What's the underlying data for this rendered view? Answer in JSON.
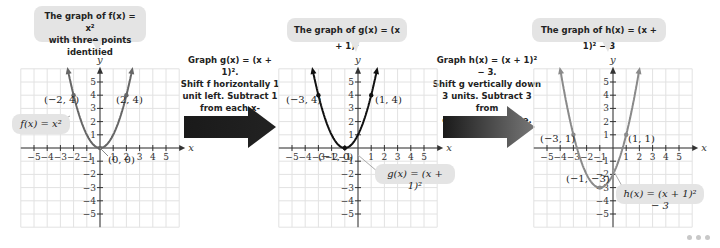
{
  "callouts": {
    "f_title_line1": "The graph of f(x) = x²",
    "f_title_line2": "with three points identified",
    "g_title": "The graph of g(x) = (x + 1)²",
    "h_title": "The graph of h(x) = (x + 1)² − 3"
  },
  "steps": {
    "step1": [
      "Graph g(x) = (x + 1)².",
      "Shift f horizontally 1",
      "unit left. Subtract 1",
      "from each x-coordinate."
    ],
    "step2": [
      "Graph h(x) = (x + 1)² − 3.",
      "Shift g vertically down",
      "3 units. Subtract 3 from",
      "each y-coordinate."
    ]
  },
  "labels": {
    "f_label": "f(x) = x²",
    "g_label": "g(x) = (x + 1)²",
    "h_label": "h(x) = (x + 1)² − 3",
    "x_axis": "x",
    "y_axis": "y"
  },
  "chart_data": [
    {
      "type": "line",
      "title": "The graph of f(x) = x² with three points identified",
      "function": "f(x) = x^2",
      "xlabel": "x",
      "ylabel": "y",
      "xlim": [
        -6,
        6
      ],
      "ylim": [
        -6,
        6
      ],
      "x_ticks": [
        -5,
        -4,
        -3,
        -2,
        -1,
        1,
        2,
        3,
        4,
        5
      ],
      "y_ticks": [
        -5,
        -4,
        -3,
        -2,
        -1,
        1,
        2,
        3,
        4,
        5
      ],
      "grid": true,
      "color": "#666666",
      "points": [
        {
          "x": -2,
          "y": 4,
          "label": "(−2, 4)"
        },
        {
          "x": 0,
          "y": 0,
          "label": "(0, 0)"
        },
        {
          "x": 2,
          "y": 4,
          "label": "(2, 4)"
        }
      ]
    },
    {
      "type": "line",
      "title": "The graph of g(x) = (x + 1)²",
      "function": "g(x) = (x+1)^2",
      "xlabel": "x",
      "ylabel": "y",
      "xlim": [
        -6,
        6
      ],
      "ylim": [
        -6,
        6
      ],
      "x_ticks": [
        -5,
        -4,
        -3,
        -2,
        -1,
        1,
        2,
        3,
        4,
        5
      ],
      "y_ticks": [
        -5,
        -4,
        -3,
        -2,
        -1,
        1,
        2,
        3,
        4,
        5
      ],
      "grid": true,
      "color": "#111111",
      "points": [
        {
          "x": -3,
          "y": 4,
          "label": "(−3, 4)"
        },
        {
          "x": -1,
          "y": 0,
          "label": "(−1, 0)"
        },
        {
          "x": 1,
          "y": 4,
          "label": "(1, 4)"
        }
      ]
    },
    {
      "type": "line",
      "title": "The graph of h(x) = (x + 1)² − 3",
      "function": "h(x) = (x+1)^2 - 3",
      "xlabel": "x",
      "ylabel": "y",
      "xlim": [
        -6,
        6
      ],
      "ylim": [
        -6,
        6
      ],
      "x_ticks": [
        -5,
        -4,
        -3,
        -2,
        -1,
        1,
        2,
        3,
        4,
        5
      ],
      "y_ticks": [
        -5,
        -4,
        -3,
        -2,
        -1,
        1,
        2,
        3,
        4,
        5
      ],
      "grid": true,
      "color": "#8a8a8a",
      "points": [
        {
          "x": -3,
          "y": 1,
          "label": "(−3, 1)"
        },
        {
          "x": -1,
          "y": -3,
          "label": "(−1, −3)"
        },
        {
          "x": 1,
          "y": 1,
          "label": "(1, 1)"
        }
      ]
    }
  ]
}
